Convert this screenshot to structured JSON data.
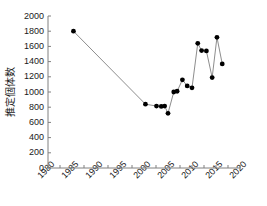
{
  "chart_data": {
    "type": "line",
    "title": "",
    "subtitle": "",
    "xlabel": "",
    "ylabel": "推定個体数",
    "xlim": [
      1980,
      2020
    ],
    "ylim": [
      0,
      2000
    ],
    "xticks": [
      1980,
      1985,
      1990,
      1995,
      2000,
      2005,
      2010,
      2015,
      2020
    ],
    "xtick_labels": [
      "1980",
      "1985",
      "1990",
      "1995",
      "2000",
      "2005",
      "2010",
      "2015",
      "2020"
    ],
    "x_minor_tick_interval": 2.5,
    "yticks": [
      0,
      200,
      400,
      600,
      800,
      1000,
      1200,
      1400,
      1600,
      1800,
      2000
    ],
    "ytick_labels": [
      "0",
      "200",
      "400",
      "600",
      "800",
      "1000",
      "1200",
      "1400",
      "1600",
      "1800",
      "2000"
    ],
    "grid": false,
    "legend": null,
    "legend_position": "none",
    "marker": "filled-circle",
    "marker_color": "#000000",
    "line_color": "#808080",
    "axis_color": "#808080",
    "series": [
      {
        "name": "推定個体数",
        "points": [
          {
            "x": 1985.3,
            "y": 1800
          },
          {
            "x": 2000.3,
            "y": 840
          },
          {
            "x": 2002.6,
            "y": 815
          },
          {
            "x": 2003.6,
            "y": 810
          },
          {
            "x": 2004.3,
            "y": 815
          },
          {
            "x": 2005.0,
            "y": 720
          },
          {
            "x": 2006.2,
            "y": 1000
          },
          {
            "x": 2006.9,
            "y": 1010
          },
          {
            "x": 2008.0,
            "y": 1160
          },
          {
            "x": 2009.0,
            "y": 1080
          },
          {
            "x": 2010.0,
            "y": 1055
          },
          {
            "x": 2011.2,
            "y": 1640
          },
          {
            "x": 2012.0,
            "y": 1545
          },
          {
            "x": 2013.0,
            "y": 1540
          },
          {
            "x": 2014.2,
            "y": 1190
          },
          {
            "x": 2015.2,
            "y": 1720
          },
          {
            "x": 2016.3,
            "y": 1370
          }
        ]
      }
    ]
  },
  "geometry": {
    "plot_left": 48,
    "plot_right": 240,
    "plot_top": 16,
    "plot_bottom": 168
  }
}
